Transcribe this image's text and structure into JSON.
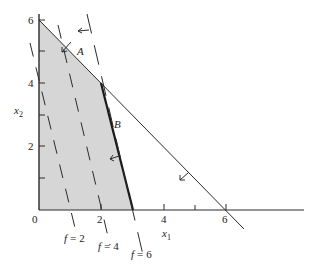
{
  "figure": {
    "type": "linear-programming-feasible-region",
    "axes": {
      "x_label": "x",
      "x_label_sub": "1",
      "y_label": "x",
      "y_label_sub": "2",
      "origin_label": "0",
      "x_ticks": [
        {
          "value": 2,
          "label": "2"
        },
        {
          "value": 4,
          "label": "4"
        },
        {
          "value": 6,
          "label": "6"
        }
      ],
      "x_minor_ticks": [
        5
      ],
      "y_ticks": [
        {
          "value": 2,
          "label": "2"
        },
        {
          "value": 4,
          "label": "4"
        },
        {
          "value": 6,
          "label": "6"
        }
      ],
      "y_minor_ticks": [
        1,
        3,
        5
      ]
    },
    "constraints": [
      {
        "name": "A",
        "label": "A",
        "description": "line from (0,6) to (6,0)"
      },
      {
        "name": "B",
        "label": "B",
        "description": "bold segment from (2,4) to (3,0)"
      }
    ],
    "feasible_region": {
      "vertices": [
        [
          0,
          0
        ],
        [
          0,
          6
        ],
        [
          2,
          4
        ],
        [
          3,
          0
        ]
      ],
      "fill": "#d6d6d6"
    },
    "objective_contours": [
      {
        "label": "f = 2",
        "f_symbol": "f",
        "eq": "=",
        "value": "2"
      },
      {
        "label": "f = 4",
        "f_symbol": "f",
        "eq": "=",
        "value": "4"
      },
      {
        "label": "f = 6",
        "f_symbol": "f",
        "eq": "=",
        "value": "6"
      }
    ],
    "colors": {
      "line": "#2a2a2a",
      "region": "#d6d6d6",
      "background": "#ffffff"
    }
  }
}
